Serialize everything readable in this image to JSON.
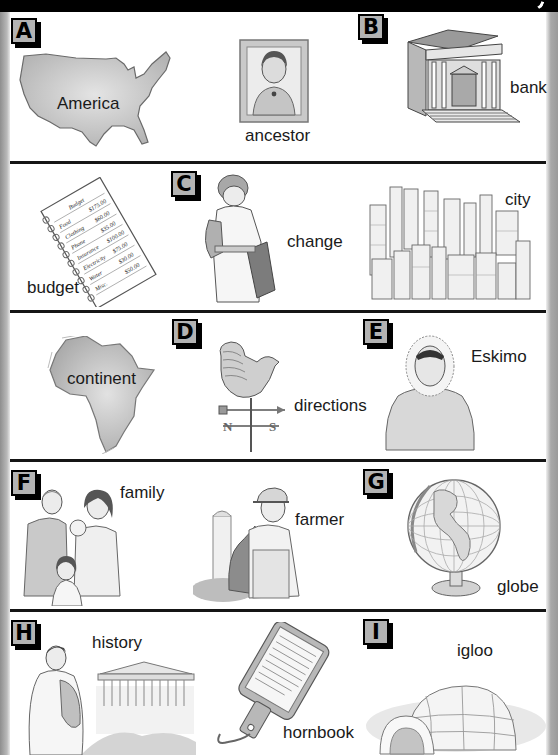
{
  "page": {
    "title_bar_color": "#000000",
    "separator_color": "#151515",
    "badge_fill": "#b3b3b3"
  },
  "sections": [
    {
      "letter": "A",
      "items": [
        {
          "word": "America",
          "icon": "usa-map-icon"
        },
        {
          "word": "ancestor",
          "icon": "framed-portrait-icon"
        }
      ]
    },
    {
      "letter": "B",
      "items": [
        {
          "word": "bank",
          "icon": "bank-building-icon"
        }
      ]
    },
    {
      "letter": "C",
      "items": [
        {
          "word": "budget",
          "icon": "budget-notepad-icon",
          "notepad": {
            "title": "Budget",
            "lines": [
              {
                "item": "Food",
                "amount": "$175.00"
              },
              {
                "item": "Clothing",
                "amount": "$60.00"
              },
              {
                "item": "Phone",
                "amount": "$35.00"
              },
              {
                "item": "Insurance",
                "amount": "$100.00"
              },
              {
                "item": "Electricity",
                "amount": "$75.00"
              },
              {
                "item": "Water",
                "amount": "$30.00"
              },
              {
                "item": "Misc.",
                "amount": "$50.00"
              }
            ]
          }
        },
        {
          "word": "change",
          "icon": "boy-changing-clothes-icon"
        },
        {
          "word": "city",
          "icon": "city-skyline-icon"
        }
      ]
    },
    {
      "letter": "D",
      "items": [
        {
          "word": "continent",
          "icon": "africa-map-icon"
        },
        {
          "word": "directions",
          "icon": "weather-vane-icon",
          "compass": [
            "N",
            "S"
          ]
        }
      ]
    },
    {
      "letter": "E",
      "items": [
        {
          "word": "Eskimo",
          "icon": "eskimo-parka-icon"
        }
      ]
    },
    {
      "letter": "F",
      "items": [
        {
          "word": "family",
          "icon": "family-group-icon"
        },
        {
          "word": "farmer",
          "icon": "farmer-silo-icon"
        }
      ]
    },
    {
      "letter": "G",
      "items": [
        {
          "word": "globe",
          "icon": "globe-icon"
        }
      ]
    },
    {
      "letter": "H",
      "items": [
        {
          "word": "history",
          "icon": "ancient-greece-icon"
        },
        {
          "word": "hornbook",
          "icon": "hornbook-paddle-icon"
        }
      ]
    },
    {
      "letter": "I",
      "items": [
        {
          "word": "igloo",
          "icon": "igloo-icon"
        }
      ]
    }
  ]
}
